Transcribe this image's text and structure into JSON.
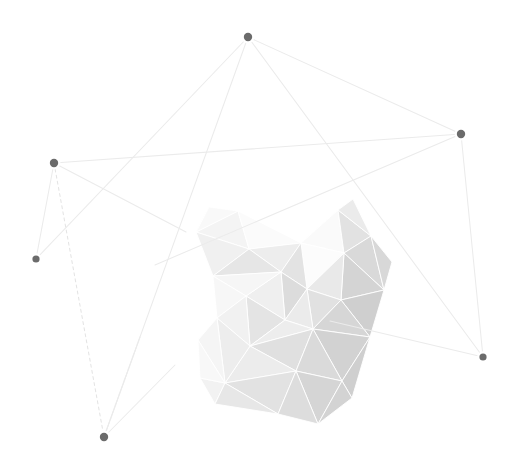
{
  "artwork": {
    "title": "Abstract low-poly crystal with node network",
    "width": 517,
    "height": 469,
    "background_color": "#ffffff"
  },
  "palette": {
    "node_color": "#6b6b6b",
    "edge_color": "#ebebeb",
    "edge_dashed_color": "#e4e4e4",
    "facet_seam_color": "#ffffff",
    "facet_lightest": "#fcfcfc",
    "facet_darkest": "#cfcfcf"
  },
  "network": {
    "nodes": [
      {
        "id": "n1",
        "label": "top-node",
        "x": 248,
        "y": 37,
        "r": 4.2
      },
      {
        "id": "n2",
        "label": "right-upper-node",
        "x": 461,
        "y": 134,
        "r": 4.2
      },
      {
        "id": "n3",
        "label": "left-node",
        "x": 54,
        "y": 163,
        "r": 4.2
      },
      {
        "id": "n4",
        "label": "left-lower-node",
        "x": 36,
        "y": 259,
        "r": 3.6
      },
      {
        "id": "n5",
        "label": "right-lower-node",
        "x": 483,
        "y": 357,
        "r": 3.6
      },
      {
        "id": "n6",
        "label": "bottom-node",
        "x": 104,
        "y": 437,
        "r": 4.2
      }
    ],
    "edges": [
      {
        "id": "e1",
        "from": "n1",
        "to": "n2",
        "style": "solid",
        "d": "M248,37 L461,134"
      },
      {
        "id": "e2",
        "from": "n1",
        "to": "n4",
        "style": "solid",
        "d": "M248,37 L36,259"
      },
      {
        "id": "e3",
        "from": "n1",
        "to": "n6",
        "style": "solid",
        "d": "M248,37 L104,437"
      },
      {
        "id": "e4",
        "from": "n1",
        "to": "n5",
        "style": "solid",
        "d": "M248,37 L483,357"
      },
      {
        "id": "e5",
        "from": "n3",
        "to": "n2",
        "style": "solid",
        "d": "M54,163 L461,134"
      },
      {
        "id": "e6",
        "from": "n3",
        "to": "n4",
        "style": "solid",
        "d": "M54,163 L36,259"
      },
      {
        "id": "e7",
        "from": "n3",
        "to": "n6",
        "style": "dashed",
        "d": "M54,163 L104,437"
      },
      {
        "id": "e8",
        "from": "n3",
        "to": "spur-a",
        "style": "solid",
        "d": "M54,163 L186,232"
      },
      {
        "id": "e9",
        "from": "n2",
        "to": "spur-b",
        "style": "solid",
        "d": "M461,134 L155,265"
      },
      {
        "id": "e10",
        "from": "n2",
        "to": "n5",
        "style": "solid",
        "d": "M461,134 L483,357"
      },
      {
        "id": "e11",
        "from": "n5",
        "to": "spur-c",
        "style": "solid",
        "d": "M483,357 L330,321"
      },
      {
        "id": "e12",
        "from": "n6",
        "to": "spur-d",
        "style": "solid",
        "d": "M104,437 L140,337"
      },
      {
        "id": "e13",
        "from": "n6",
        "to": "spur-e",
        "style": "solid",
        "d": "M104,437 L175,365"
      }
    ]
  },
  "polyhedron": {
    "label": "faceted crystal cluster",
    "facets": [
      {
        "id": "f01",
        "points": "196,232 238,211 249,249",
        "fill": "#f4f4f4"
      },
      {
        "id": "f02",
        "points": "238,211 301,243 249,249",
        "fill": "#fbfbfb"
      },
      {
        "id": "f03",
        "points": "196,232 249,249 213,276",
        "fill": "#f0f0f0"
      },
      {
        "id": "f04",
        "points": "249,249 301,243 281,272",
        "fill": "#ededed"
      },
      {
        "id": "f05",
        "points": "213,276 249,249 281,272",
        "fill": "#e6e6e6"
      },
      {
        "id": "f06",
        "points": "301,243 338,210 344,253",
        "fill": "#fafafa"
      },
      {
        "id": "f07",
        "points": "338,210 371,236 344,253",
        "fill": "#e2e2e2"
      },
      {
        "id": "f08",
        "points": "344,253 371,236 384,290",
        "fill": "#d9d9d9"
      },
      {
        "id": "f09",
        "points": "301,243 344,253 307,289",
        "fill": "#fcfcfc"
      },
      {
        "id": "f10",
        "points": "344,253 384,290 341,300",
        "fill": "#d4d4d4"
      },
      {
        "id": "f11",
        "points": "307,289 344,253 341,300",
        "fill": "#e9e9e9"
      },
      {
        "id": "f12",
        "points": "281,272 301,243 307,289",
        "fill": "#e3e3e3"
      },
      {
        "id": "f13",
        "points": "281,272 307,289 285,320",
        "fill": "#dcdcdc"
      },
      {
        "id": "f14",
        "points": "307,289 341,300 313,329",
        "fill": "#e1e1e1"
      },
      {
        "id": "f15",
        "points": "285,320 307,289 313,329",
        "fill": "#ebebeb"
      },
      {
        "id": "f16",
        "points": "341,300 384,290 370,337",
        "fill": "#cfcfcf"
      },
      {
        "id": "f17",
        "points": "313,329 341,300 370,337",
        "fill": "#d6d6d6"
      },
      {
        "id": "f18",
        "points": "246,296 281,272 285,320",
        "fill": "#efefef"
      },
      {
        "id": "f19",
        "points": "246,296 285,320 250,346",
        "fill": "#e4e4e4"
      },
      {
        "id": "f20",
        "points": "250,346 285,320 313,329",
        "fill": "#ededed"
      },
      {
        "id": "f21",
        "points": "250,346 313,329 296,371",
        "fill": "#e0e0e0"
      },
      {
        "id": "f22",
        "points": "313,329 370,337 342,381",
        "fill": "#d2d2d2"
      },
      {
        "id": "f23",
        "points": "296,371 313,329 342,381",
        "fill": "#dadada"
      },
      {
        "id": "f24",
        "points": "225,383 250,346 296,371",
        "fill": "#ececec"
      },
      {
        "id": "f25",
        "points": "225,383 296,371 278,414",
        "fill": "#e2e2e2"
      },
      {
        "id": "f26",
        "points": "296,371 342,381 318,424",
        "fill": "#d5d5d5"
      },
      {
        "id": "f27",
        "points": "278,414 296,371 318,424",
        "fill": "#dddddd"
      },
      {
        "id": "f28",
        "points": "200,378 225,383 215,404",
        "fill": "#f2f2f2"
      },
      {
        "id": "f29",
        "points": "215,404 225,383 278,414",
        "fill": "#e7e7e7"
      },
      {
        "id": "f30",
        "points": "213,276 281,272 246,296",
        "fill": "#f6f6f6"
      },
      {
        "id": "f31",
        "points": "213,276 246,296 217,318",
        "fill": "#f7f7f7"
      },
      {
        "id": "f32",
        "points": "217,318 246,296 250,346",
        "fill": "#f1f1f1"
      },
      {
        "id": "f33",
        "points": "217,318 250,346 225,383",
        "fill": "#ededed"
      },
      {
        "id": "f34",
        "points": "198,340 217,318 225,383",
        "fill": "#f5f5f5"
      },
      {
        "id": "f35",
        "points": "198,340 225,383 200,378",
        "fill": "#f8f8f8"
      },
      {
        "id": "f36",
        "points": "342,381 370,337 352,398",
        "fill": "#cfcfcf"
      },
      {
        "id": "f37",
        "points": "318,424 342,381 352,398",
        "fill": "#d3d3d3"
      },
      {
        "id": "f38",
        "points": "371,236 384,290 392,262",
        "fill": "#d8d8d8"
      },
      {
        "id": "f39",
        "points": "338,210 353,199 371,236",
        "fill": "#ebebeb"
      },
      {
        "id": "f40",
        "points": "196,232 209,207 238,211",
        "fill": "#f9f9f9"
      }
    ]
  }
}
